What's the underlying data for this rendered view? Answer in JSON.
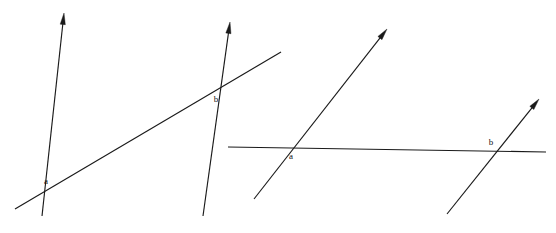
{
  "figure": {
    "background_color": "#ffffff",
    "stroke_color": "#1a1a1a",
    "label_color": "#111111",
    "width": 556,
    "height": 233
  },
  "panels": [
    {
      "id": "left-panel",
      "name": "left-figure",
      "description": "Two steeply-slanted parallel rays cut by a rising transversal segment",
      "lines": [
        {
          "id": "left-ray-a",
          "name": "left-first-ray",
          "kind": "ray",
          "arrow_at": "end",
          "x1": 42,
          "y1": 216,
          "x2": 64,
          "y2": 13
        },
        {
          "id": "left-ray-b",
          "name": "left-second-ray",
          "kind": "ray",
          "arrow_at": "end",
          "x1": 203,
          "y1": 216,
          "x2": 230,
          "y2": 22
        },
        {
          "id": "left-transversal",
          "name": "left-transversal-segment",
          "kind": "segment",
          "arrow_at": "none",
          "x1": 15,
          "y1": 209,
          "x2": 281,
          "y2": 52
        }
      ],
      "labels": [
        {
          "id": "left-label-a",
          "name": "left-intersection-label-a",
          "text": "a",
          "x": 46,
          "y": 184
        },
        {
          "id": "left-label-b",
          "name": "left-intersection-label-b",
          "text": "b",
          "x": 216,
          "y": 102
        }
      ],
      "intersections": [
        {
          "name": "left-intersection-a",
          "label": "a",
          "x": 42,
          "y": 192
        },
        {
          "name": "left-intersection-b",
          "label": "b",
          "x": 221,
          "y": 88
        }
      ]
    },
    {
      "id": "right-panel",
      "name": "right-figure",
      "description": "Two rising parallel rays cut by a horizontal transversal segment",
      "lines": [
        {
          "id": "right-ray-a",
          "name": "right-first-ray",
          "kind": "ray",
          "arrow_at": "end",
          "x1": 254,
          "y1": 199,
          "x2": 387,
          "y2": 29
        },
        {
          "id": "right-ray-b",
          "name": "right-second-ray",
          "kind": "ray",
          "arrow_at": "end",
          "x1": 447,
          "y1": 214,
          "x2": 539,
          "y2": 99
        },
        {
          "id": "right-transversal",
          "name": "right-horizontal-transversal",
          "kind": "segment",
          "arrow_at": "none",
          "x1": 228,
          "y1": 147,
          "x2": 546,
          "y2": 152
        }
      ],
      "labels": [
        {
          "id": "right-label-a",
          "name": "right-intersection-label-a",
          "text": "a",
          "x": 291,
          "y": 159
        },
        {
          "id": "right-label-b",
          "name": "right-intersection-label-b",
          "text": "b",
          "x": 491,
          "y": 145
        }
      ],
      "intersections": [
        {
          "name": "right-intersection-a",
          "label": "a",
          "x": 285,
          "y": 148
        },
        {
          "name": "right-intersection-b",
          "label": "b",
          "x": 497,
          "y": 151
        }
      ]
    }
  ]
}
